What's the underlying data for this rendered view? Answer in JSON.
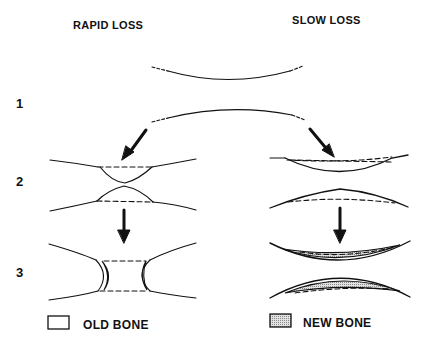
{
  "columns": {
    "left": "RAPID LOSS",
    "right": "SLOW LOSS"
  },
  "rows": [
    "1",
    "2",
    "3"
  ],
  "legend": {
    "old_bone": "OLD BONE",
    "new_bone": "NEW BONE"
  },
  "colors": {
    "ink": "#111111",
    "new_bone_fill": "#bdbdbd",
    "background": "#ffffff"
  }
}
